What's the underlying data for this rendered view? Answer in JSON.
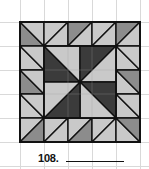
{
  "puzzle": {
    "number_label": "108.",
    "answer_value": ""
  },
  "colors": {
    "background": "#ffffff",
    "grid_line": "#d9d9d9",
    "outline": "#111111",
    "light": "#c9c9c9",
    "medium": "#8c8c8c",
    "dark": "#3b3b3b"
  },
  "quilt": {
    "origin": [
      20,
      22
    ],
    "cell_size": 24,
    "grid": [
      5,
      5
    ],
    "border_cells": [
      {
        "row": 0,
        "col": 0,
        "diag": "\\",
        "a": "medium",
        "b": "light"
      },
      {
        "row": 0,
        "col": 1,
        "diag": "/",
        "a": "light",
        "b": "light"
      },
      {
        "row": 0,
        "col": 2,
        "diag": "/",
        "a": "medium",
        "b": "light"
      },
      {
        "row": 0,
        "col": 3,
        "diag": "/",
        "a": "light",
        "b": "light"
      },
      {
        "row": 0,
        "col": 4,
        "diag": "/",
        "a": "medium",
        "b": "light"
      },
      {
        "row": 1,
        "col": 0,
        "diag": "\\",
        "a": "light",
        "b": "light"
      },
      {
        "row": 2,
        "col": 0,
        "diag": "\\",
        "a": "medium",
        "b": "light"
      },
      {
        "row": 3,
        "col": 0,
        "diag": "\\",
        "a": "light",
        "b": "light"
      },
      {
        "row": 1,
        "col": 4,
        "diag": "\\",
        "a": "light",
        "b": "light"
      },
      {
        "row": 2,
        "col": 4,
        "diag": "\\",
        "a": "light",
        "b": "medium"
      },
      {
        "row": 3,
        "col": 4,
        "diag": "\\",
        "a": "light",
        "b": "light"
      },
      {
        "row": 4,
        "col": 0,
        "diag": "/",
        "a": "light",
        "b": "medium"
      },
      {
        "row": 4,
        "col": 1,
        "diag": "/",
        "a": "light",
        "b": "light"
      },
      {
        "row": 4,
        "col": 2,
        "diag": "/",
        "a": "light",
        "b": "medium"
      },
      {
        "row": 4,
        "col": 3,
        "diag": "/",
        "a": "light",
        "b": "light"
      },
      {
        "row": 4,
        "col": 4,
        "diag": "\\",
        "a": "light",
        "b": "medium"
      }
    ],
    "pinwheel": {
      "quadrants": [
        {
          "name": "top-left",
          "dark_triangle": "lower-left"
        },
        {
          "name": "top-right",
          "dark_triangle": "upper-left"
        },
        {
          "name": "bottom-right",
          "dark_triangle": "upper-right"
        },
        {
          "name": "bottom-left",
          "dark_triangle": "lower-right"
        }
      ]
    }
  }
}
